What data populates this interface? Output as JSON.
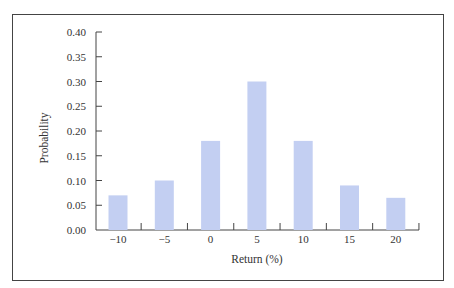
{
  "chart_data": {
    "type": "bar",
    "title": "",
    "xlabel": "Return (%)",
    "ylabel": "Probability",
    "categories": [
      "−10",
      "−5",
      "0",
      "5",
      "10",
      "15",
      "20"
    ],
    "values": [
      0.07,
      0.1,
      0.18,
      0.3,
      0.18,
      0.09,
      0.065
    ],
    "ylim": [
      0,
      0.4
    ],
    "yticks": [
      "0.00",
      "0.05",
      "0.10",
      "0.15",
      "0.20",
      "0.25",
      "0.30",
      "0.35",
      "0.40"
    ],
    "grid": false,
    "legend": null,
    "bar_color": "#c3cff2"
  }
}
